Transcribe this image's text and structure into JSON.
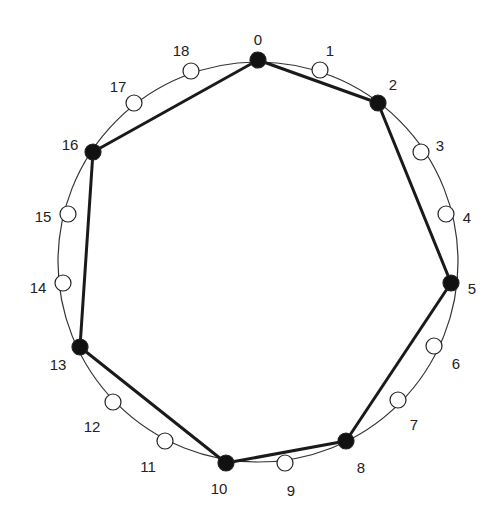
{
  "diagram": {
    "type": "circular-graph",
    "circle": {
      "cx": 258,
      "cy": 262,
      "r": 200
    },
    "colors": {
      "filled": "#111111",
      "empty": "#ffffff",
      "stroke": "#222222",
      "edge": "#1a1a1a"
    },
    "nodes": [
      {
        "id": "0",
        "label": "0",
        "x": 258,
        "y": 60,
        "filled": true,
        "lx": 258,
        "ly": 41
      },
      {
        "id": "1",
        "label": "1",
        "x": 320,
        "y": 70,
        "filled": false,
        "lx": 330,
        "ly": 52
      },
      {
        "id": "2",
        "label": "2",
        "x": 378,
        "y": 103,
        "filled": true,
        "lx": 393,
        "ly": 86
      },
      {
        "id": "3",
        "label": "3",
        "x": 421,
        "y": 152,
        "filled": false,
        "lx": 440,
        "ly": 147
      },
      {
        "id": "4",
        "label": "4",
        "x": 446,
        "y": 214,
        "filled": false,
        "lx": 467,
        "ly": 219
      },
      {
        "id": "5",
        "label": "5",
        "x": 451,
        "y": 283,
        "filled": true,
        "lx": 472,
        "ly": 290
      },
      {
        "id": "6",
        "label": "6",
        "x": 434,
        "y": 346,
        "filled": false,
        "lx": 456,
        "ly": 365
      },
      {
        "id": "7",
        "label": "7",
        "x": 398,
        "y": 400,
        "filled": false,
        "lx": 414,
        "ly": 426
      },
      {
        "id": "8",
        "label": "8",
        "x": 346,
        "y": 441,
        "filled": true,
        "lx": 361,
        "ly": 469
      },
      {
        "id": "9",
        "label": "9",
        "x": 285,
        "y": 463,
        "filled": false,
        "lx": 291,
        "ly": 492
      },
      {
        "id": "10",
        "label": "10",
        "x": 226,
        "y": 463,
        "filled": true,
        "lx": 219,
        "ly": 490
      },
      {
        "id": "11",
        "label": "11",
        "x": 165,
        "y": 441,
        "filled": false,
        "lx": 148,
        "ly": 468
      },
      {
        "id": "12",
        "label": "12",
        "x": 113,
        "y": 402,
        "filled": false,
        "lx": 92,
        "ly": 428
      },
      {
        "id": "13",
        "label": "13",
        "x": 80,
        "y": 347,
        "filled": true,
        "lx": 58,
        "ly": 366
      },
      {
        "id": "14",
        "label": "14",
        "x": 63,
        "y": 283,
        "filled": false,
        "lx": 38,
        "ly": 289
      },
      {
        "id": "15",
        "label": "15",
        "x": 68,
        "y": 214,
        "filled": false,
        "lx": 43,
        "ly": 218
      },
      {
        "id": "16",
        "label": "16",
        "x": 93,
        "y": 152,
        "filled": true,
        "lx": 70,
        "ly": 146
      },
      {
        "id": "17",
        "label": "17",
        "x": 134,
        "y": 103,
        "filled": false,
        "lx": 118,
        "ly": 88
      },
      {
        "id": "18",
        "label": "18",
        "x": 191,
        "y": 71,
        "filled": false,
        "lx": 181,
        "ly": 52
      }
    ],
    "polygon": [
      "0",
      "2",
      "5",
      "8",
      "10",
      "13",
      "16"
    ],
    "node_radius": 8
  }
}
